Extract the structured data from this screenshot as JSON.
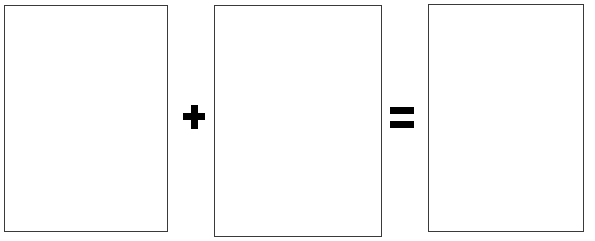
{
  "figure": {
    "type": "image-equation",
    "background_color": "#ffffff",
    "stroke_color": "#3a3a3a",
    "operator_color": "#000000",
    "caption": "",
    "title": ""
  },
  "panels": [
    {
      "id": "panel-1",
      "label": "",
      "content": "",
      "fill_color": "#ffffff",
      "border_color": "#3a3a3a",
      "x": 4,
      "y": 5,
      "width": 164,
      "height": 227
    },
    {
      "id": "panel-2",
      "label": "",
      "content": "",
      "fill_color": "#ffffff",
      "border_color": "#3a3a3a",
      "x": 214,
      "y": 5,
      "width": 168,
      "height": 232
    },
    {
      "id": "panel-3",
      "label": "",
      "content": "",
      "fill_color": "#ffffff",
      "border_color": "#3a3a3a",
      "x": 428,
      "y": 4,
      "width": 156,
      "height": 228
    }
  ],
  "operators": [
    {
      "id": "operator-plus",
      "icon": "plus-icon",
      "symbol": "+",
      "x": 183,
      "y": 105,
      "width": 22,
      "height": 24
    },
    {
      "id": "operator-equals",
      "icon": "equals-icon",
      "symbol": "=",
      "x": 390,
      "y": 107,
      "width": 24,
      "height": 21
    }
  ]
}
